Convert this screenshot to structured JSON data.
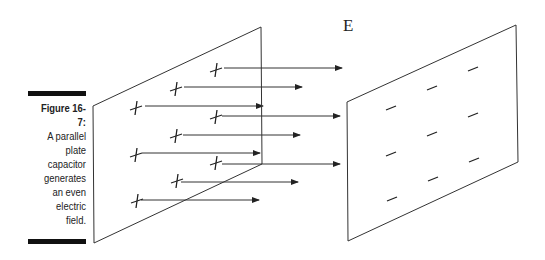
{
  "caption": {
    "figure_label": "Figure 16-7:",
    "lines": [
      "A parallel",
      "plate",
      "capacitor",
      "generates",
      "an even",
      "electric",
      "field."
    ]
  },
  "diagram": {
    "field_label": "E",
    "positive_plate": {
      "charge_symbol": "+",
      "charges": 9
    },
    "negative_plate": {
      "charge_symbol": "−",
      "charges": 9
    },
    "field_lines": 9,
    "line_color": "#222222"
  }
}
